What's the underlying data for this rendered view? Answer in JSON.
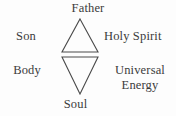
{
  "diagram": {
    "background_color": "#fdfdfd",
    "stroke_color": "#4a4a4a",
    "text_color": "#3b3b3b",
    "labels": {
      "top": "Father",
      "upper_left": "Son",
      "upper_right": "Holy Spirit",
      "lower_left": "Body",
      "lower_right_line1": "Universal",
      "lower_right_line2": "Energy",
      "bottom": "Soul"
    },
    "shapes": [
      {
        "name": "upward-triangle",
        "orientation": "up",
        "apex": [
          80,
          19
        ],
        "base_left": [
          62,
          52
        ],
        "base_right": [
          98,
          52
        ]
      },
      {
        "name": "downward-triangle",
        "orientation": "down",
        "apex": [
          80,
          94
        ],
        "base_left": [
          62,
          57
        ],
        "base_right": [
          98,
          57
        ]
      }
    ]
  }
}
